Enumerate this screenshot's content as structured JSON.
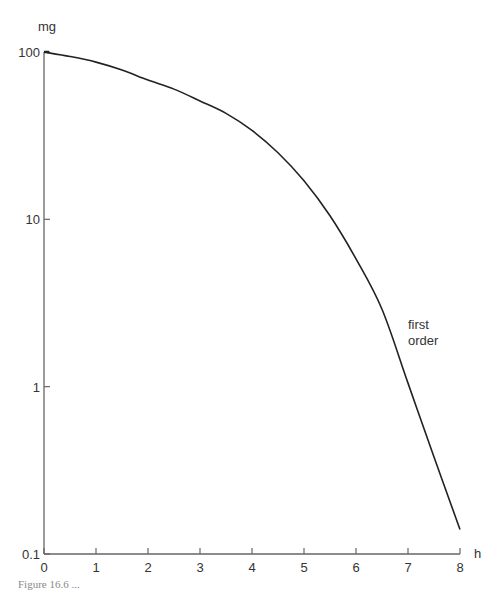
{
  "chart_data": {
    "type": "line",
    "title": "",
    "xlabel": "h",
    "ylabel": "mg",
    "yscale": "log",
    "xlim": [
      0,
      8
    ],
    "ylim": [
      0.1,
      100
    ],
    "grid": false,
    "xticks": [
      0,
      1,
      2,
      3,
      4,
      5,
      6,
      7,
      8
    ],
    "xtick_labels": [
      "0",
      "1",
      "2",
      "3",
      "4",
      "5",
      "6",
      "7",
      "8"
    ],
    "yticks": [
      0.1,
      1,
      10,
      100
    ],
    "ytick_labels": [
      "0.1",
      "1",
      "10",
      "100"
    ],
    "series": [
      {
        "name": "drug amount",
        "x": [
          0,
          0.5,
          1,
          1.5,
          2,
          2.5,
          3,
          3.5,
          4,
          4.5,
          5,
          5.5,
          6,
          6.5,
          7,
          7.5,
          8
        ],
        "y": [
          100,
          94,
          87,
          78,
          68,
          60,
          51,
          43,
          34,
          25,
          17,
          10.5,
          5.8,
          2.9,
          1.05,
          0.38,
          0.14
        ]
      }
    ],
    "annotations": [
      {
        "text_lines": [
          "first",
          "order"
        ],
        "at_x": 7.0,
        "at_y": 2.2
      }
    ]
  },
  "caption": "Figure 16.6 ..."
}
